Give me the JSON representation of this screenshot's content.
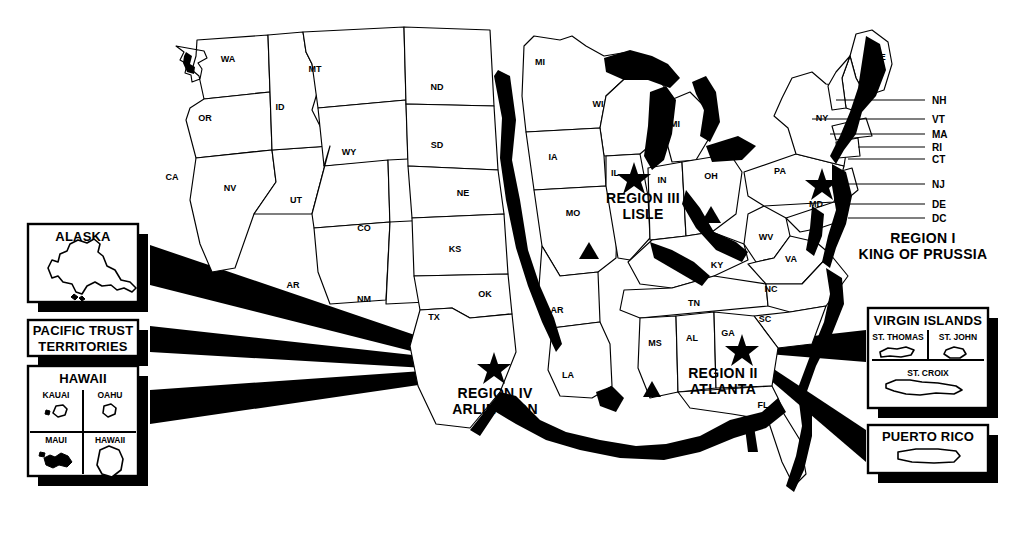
{
  "figure": {
    "type": "map",
    "background": "#ffffff",
    "ink": "#000000",
    "width": 1020,
    "height": 538
  },
  "states": [
    {
      "abbr": "WA",
      "x": 228,
      "y": 62
    },
    {
      "abbr": "OR",
      "x": 205,
      "y": 121
    },
    {
      "abbr": "CA",
      "x": 172,
      "y": 180
    },
    {
      "abbr": "NV",
      "x": 230,
      "y": 191
    },
    {
      "abbr": "ID",
      "x": 280,
      "y": 110
    },
    {
      "abbr": "MT",
      "x": 315,
      "y": 72
    },
    {
      "abbr": "WY",
      "x": 349,
      "y": 155
    },
    {
      "abbr": "UT",
      "x": 296,
      "y": 203
    },
    {
      "abbr": "CO",
      "x": 364,
      "y": 231
    },
    {
      "abbr": "AR",
      "x": 293,
      "y": 288
    },
    {
      "abbr": "NM",
      "x": 364,
      "y": 302
    },
    {
      "abbr": "TX",
      "x": 434,
      "y": 320
    },
    {
      "abbr": "ND",
      "x": 437,
      "y": 90
    },
    {
      "abbr": "SD",
      "x": 437,
      "y": 148
    },
    {
      "abbr": "NE",
      "x": 463,
      "y": 196
    },
    {
      "abbr": "KS",
      "x": 455,
      "y": 252
    },
    {
      "abbr": "OK",
      "x": 485,
      "y": 297
    },
    {
      "abbr": "MI",
      "x": 540,
      "y": 65
    },
    {
      "abbr": "WI",
      "x": 598,
      "y": 107
    },
    {
      "abbr": "IA",
      "x": 553,
      "y": 160
    },
    {
      "abbr": "MO",
      "x": 573,
      "y": 216
    },
    {
      "abbr": "AR",
      "x": 557,
      "y": 313
    },
    {
      "abbr": "LA",
      "x": 568,
      "y": 378
    },
    {
      "abbr": "MI",
      "x": 675,
      "y": 127
    },
    {
      "abbr": "IL",
      "x": 615,
      "y": 176
    },
    {
      "abbr": "IN",
      "x": 662,
      "y": 183
    },
    {
      "abbr": "OH",
      "x": 711,
      "y": 179
    },
    {
      "abbr": "KY",
      "x": 717,
      "y": 268
    },
    {
      "abbr": "TN",
      "x": 694,
      "y": 306
    },
    {
      "abbr": "MS",
      "x": 655,
      "y": 346
    },
    {
      "abbr": "AL",
      "x": 692,
      "y": 341
    },
    {
      "abbr": "GA",
      "x": 728,
      "y": 336
    },
    {
      "abbr": "FL",
      "x": 763,
      "y": 408
    },
    {
      "abbr": "SC",
      "x": 765,
      "y": 322
    },
    {
      "abbr": "NC",
      "x": 771,
      "y": 292
    },
    {
      "abbr": "WV",
      "x": 766,
      "y": 240
    },
    {
      "abbr": "VA",
      "x": 791,
      "y": 262
    },
    {
      "abbr": "PA",
      "x": 780,
      "y": 174
    },
    {
      "abbr": "MD",
      "x": 816,
      "y": 207
    },
    {
      "abbr": "NY",
      "x": 822,
      "y": 121
    },
    {
      "abbr": "ME",
      "x": 879,
      "y": 60
    }
  ],
  "leader_labels": [
    {
      "abbr": "NH",
      "x": 932,
      "y": 103,
      "line_y": 100,
      "line_x1": 836,
      "line_x2": 925
    },
    {
      "abbr": "VT",
      "x": 932,
      "y": 122,
      "line_y": 119,
      "line_x1": 812,
      "line_x2": 925
    },
    {
      "abbr": "MA",
      "x": 932,
      "y": 137,
      "line_y": 134,
      "line_x1": 830,
      "line_x2": 925
    },
    {
      "abbr": "RI",
      "x": 932,
      "y": 150,
      "line_y": 147,
      "line_x1": 858,
      "line_x2": 925
    },
    {
      "abbr": "CT",
      "x": 932,
      "y": 162,
      "line_y": 159,
      "line_x1": 848,
      "line_x2": 925
    },
    {
      "abbr": "NJ",
      "x": 932,
      "y": 187,
      "line_y": 184,
      "line_x1": 840,
      "line_x2": 925
    },
    {
      "abbr": "DE",
      "x": 932,
      "y": 207,
      "line_y": 204,
      "line_x1": 848,
      "line_x2": 925
    },
    {
      "abbr": "DC",
      "x": 932,
      "y": 221,
      "line_y": 218,
      "line_x1": 848,
      "line_x2": 925
    }
  ],
  "regions": [
    {
      "id": "region-1",
      "name": "REGION I",
      "city": "KING OF PRUSSIA",
      "label_x": 923,
      "label_y": 243,
      "star_x": 822,
      "star_y": 182
    },
    {
      "id": "region-2",
      "name": "REGION II",
      "city": "ATLANTA",
      "label_x": 723,
      "label_y": 375,
      "star_x": 742,
      "star_y": 348
    },
    {
      "id": "region-3",
      "name": "REGION III",
      "city": "LISLE",
      "label_x": 643,
      "label_y": 200,
      "star_x": 634,
      "star_y": 176
    },
    {
      "id": "region-4",
      "name": "REGION IV",
      "city": "ARLINGTON",
      "label_x": 495,
      "label_y": 373,
      "star_x": 494,
      "star_y": 367
    }
  ],
  "triangles": [
    {
      "id": "triangle-missouri",
      "x": 589,
      "y": 252
    },
    {
      "id": "triangle-ohio",
      "x": 711,
      "y": 216
    },
    {
      "id": "triangle-mississippi",
      "x": 652,
      "y": 390
    }
  ],
  "insets": [
    {
      "id": "alaska",
      "title": "ALASKA",
      "x": 28,
      "y": 224,
      "w": 110,
      "h": 78
    },
    {
      "id": "pacific-trust-territories",
      "title": "PACIFIC TRUST",
      "title2": "TERRITORIES",
      "x": 28,
      "y": 320,
      "w": 110,
      "h": 36
    },
    {
      "id": "hawaii",
      "title": "HAWAII",
      "x": 28,
      "y": 366,
      "w": 110,
      "h": 110,
      "cells": [
        "KAUAI",
        "OAHU",
        "MAUI",
        "HAWAII"
      ]
    },
    {
      "id": "virgin-islands",
      "title": "VIRGIN ISLANDS",
      "x": 868,
      "y": 308,
      "w": 120,
      "h": 100,
      "cells": [
        "ST. THOMAS",
        "ST. JOHN",
        "ST. CROIX"
      ]
    },
    {
      "id": "puerto-rico",
      "title": "PUERTO RICO",
      "x": 868,
      "y": 425,
      "w": 120,
      "h": 48
    }
  ]
}
